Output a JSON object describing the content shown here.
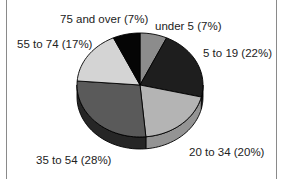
{
  "chart_data": {
    "type": "pie",
    "style": "3d",
    "title": "",
    "start_angle": "12 o'clock",
    "direction": "clockwise",
    "categories": [
      "under 5",
      "5 to 19",
      "20 to 34",
      "35 to 54",
      "55 to 74",
      "75 and over"
    ],
    "values": [
      7,
      22,
      20,
      28,
      17,
      7
    ],
    "unit": "%",
    "labels": [
      "under 5 (7%)",
      "5 to 19 (22%)",
      "20 to 34 (20%)",
      "35 to 54 (28%)",
      "55 to 74 (17%)",
      "75 and over (7%)"
    ],
    "colors": [
      "#8c8c8c",
      "#1e1e1e",
      "#b4b4b4",
      "#5a5a5a",
      "#d4d4d4",
      "#050505"
    ],
    "side_colors": [
      "#6e6e6e",
      "#141414",
      "#949494",
      "#262626",
      "#b0b0b0",
      "#000000"
    ],
    "legend": "none (labels placed outside slices)"
  }
}
